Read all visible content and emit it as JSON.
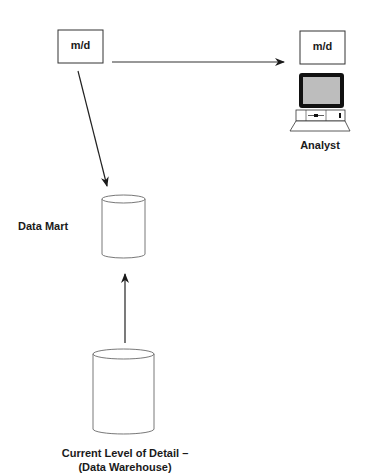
{
  "diagram": {
    "nodes": {
      "md_left": {
        "label": "m/d"
      },
      "md_right": {
        "label": "m/d"
      },
      "analyst": {
        "label": "Analyst"
      },
      "data_mart": {
        "label": "Data Mart"
      },
      "warehouse": {
        "label_line1": "Current Level of Detail –",
        "label_line2": "(Data Warehouse)"
      }
    },
    "edges": [
      {
        "from": "md_left",
        "to": "md_right"
      },
      {
        "from": "md_left",
        "to": "data_mart"
      },
      {
        "from": "warehouse",
        "to": "data_mart"
      }
    ]
  }
}
